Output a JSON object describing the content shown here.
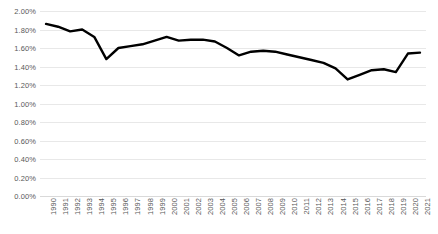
{
  "chart_data": {
    "type": "line",
    "title": "",
    "subtitle": "",
    "xlabel": "",
    "ylabel": "",
    "grid": true,
    "legend": false,
    "legend_position": "none",
    "line_color": "#000000",
    "axis_text_color": "#595959",
    "gridline_color": "#e8e8e8",
    "ylim": [
      0,
      0.02
    ],
    "y_tick_format": "percent-2dp",
    "y_ticks": [
      0,
      0.002,
      0.004,
      0.006,
      0.008,
      0.01,
      0.012,
      0.014,
      0.016,
      0.018,
      0.02
    ],
    "y_tick_labels": [
      "0.00%",
      "0.20%",
      "0.40%",
      "0.60%",
      "0.80%",
      "1.00%",
      "1.20%",
      "1.40%",
      "1.60%",
      "1.80%",
      "2.00%"
    ],
    "categories": [
      "1990",
      "1991",
      "1992",
      "1993",
      "1994",
      "1995",
      "1996",
      "1997",
      "1998",
      "1999",
      "2000",
      "2001",
      "2002",
      "2003",
      "2004",
      "2005",
      "2006",
      "2007",
      "2008",
      "2009",
      "2010",
      "2011",
      "2012",
      "2013",
      "2014",
      "2015",
      "2016",
      "2017",
      "2018",
      "2019",
      "2020",
      "2021"
    ],
    "values": [
      0.0186,
      0.0183,
      0.0178,
      0.018,
      0.0172,
      0.0148,
      0.016,
      0.0162,
      0.0164,
      0.0168,
      0.0172,
      0.0168,
      0.0169,
      0.0169,
      0.0167,
      0.016,
      0.0152,
      0.0156,
      0.0157,
      0.0156,
      0.0153,
      0.015,
      0.0147,
      0.0144,
      0.0138,
      0.0126,
      0.0131,
      0.0136,
      0.0137,
      0.0134,
      0.0154,
      0.0155
    ]
  }
}
